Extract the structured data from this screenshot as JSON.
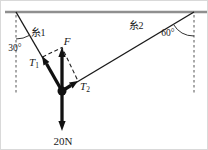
{
  "diagram": {
    "labels": {
      "string1": "糸1",
      "string2": "糸2",
      "angle_left": "30°",
      "angle_right": "60°",
      "resultant": "F",
      "tension1_base": "T",
      "tension1_sub": "1",
      "tension2_base": "T",
      "tension2_sub": "2",
      "weight": "20N"
    },
    "colors": {
      "line": "#1a1a1a",
      "ceiling": "#8f8f8f",
      "dashed_guide": "#555555",
      "background": "#ffffff"
    }
  }
}
